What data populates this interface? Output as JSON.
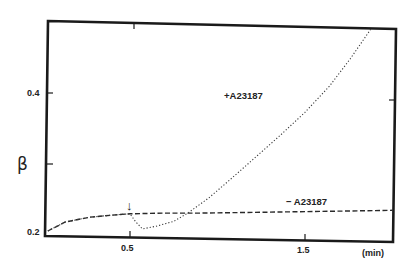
{
  "chart_data": {
    "type": "line",
    "title": "",
    "xlabel": "(min)",
    "ylabel": "β",
    "xlim": [
      0.0,
      2.0
    ],
    "ylim": [
      0.2,
      0.5
    ],
    "x_ticks": [
      {
        "value": 0.5,
        "label": "0.5"
      },
      {
        "value": 1.5,
        "label": "1.5"
      }
    ],
    "y_ticks": [
      {
        "value": 0.2,
        "label": "0.2"
      },
      {
        "value": 0.3,
        "label": ""
      },
      {
        "value": 0.4,
        "label": "0.4"
      }
    ],
    "grid": false,
    "legend": "none (inline annotations)",
    "annotations": [
      {
        "text": "+A23187",
        "x": 1.02,
        "y": 0.405
      },
      {
        "text": "− A23187",
        "x": 1.3,
        "y": 0.234
      },
      {
        "text": "↓",
        "x": 0.5,
        "y": 0.245,
        "meaning": "addition point"
      }
    ],
    "series": [
      {
        "name": "− A23187",
        "style": "dashed",
        "x": [
          0.03,
          0.13,
          0.27,
          0.4,
          0.5,
          0.7,
          0.9,
          1.2,
          1.47,
          1.75,
          2.0
        ],
        "y": [
          0.2,
          0.213,
          0.22,
          0.223,
          0.225,
          0.226,
          0.226,
          0.227,
          0.228,
          0.229,
          0.23
        ]
      },
      {
        "name": "+A23187",
        "style": "dotted",
        "x": [
          0.03,
          0.13,
          0.27,
          0.4,
          0.5,
          0.53,
          0.57,
          0.65,
          0.75,
          0.83,
          0.95,
          1.07,
          1.2,
          1.36,
          1.5,
          1.64,
          1.76,
          1.88
        ],
        "y": [
          0.2,
          0.213,
          0.22,
          0.223,
          0.225,
          0.214,
          0.203,
          0.207,
          0.214,
          0.226,
          0.248,
          0.274,
          0.303,
          0.339,
          0.372,
          0.41,
          0.45,
          0.494
        ]
      }
    ]
  },
  "labels": {
    "y_axis": "β",
    "x_unit": "(min)",
    "tick_x_05": "0.5",
    "tick_x_15": "1.5",
    "tick_y_02": "0.2",
    "tick_y_04": "0.4",
    "plus_series": "+A23187",
    "minus_series": "− A23187",
    "arrow": "↓"
  }
}
